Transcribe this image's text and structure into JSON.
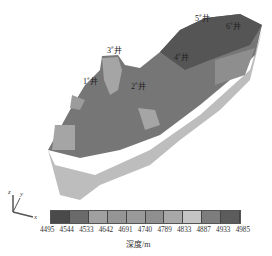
{
  "wells": [
    {
      "id": "1#",
      "label": "1",
      "x": 83,
      "y": 75
    },
    {
      "id": "2#",
      "label": "2",
      "x": 131,
      "y": 80
    },
    {
      "id": "3#",
      "label": "3",
      "x": 107,
      "y": 44
    },
    {
      "id": "4#",
      "label": "4",
      "x": 174,
      "y": 51
    },
    {
      "id": "5#",
      "label": "5",
      "x": 195,
      "y": 12
    },
    {
      "id": "6#",
      "label": "6",
      "x": 226,
      "y": 20
    }
  ],
  "well_suffix": "井",
  "legend": {
    "colors": [
      "#4a4a4a",
      "#6a6a6a",
      "#a0a0a0",
      "#959595",
      "#9a9a9a",
      "#8f8f8f",
      "#a8a8a8",
      "#c4c4c4",
      "#7d7d7d",
      "#5c5c5c"
    ],
    "ticks": [
      "4495",
      "4544",
      "4533",
      "4642",
      "4691",
      "4740",
      "4789",
      "4833",
      "4887",
      "4933",
      "4985"
    ],
    "unit": "深度/m"
  },
  "axes": {
    "z": "z",
    "y": "y",
    "x": "x"
  }
}
